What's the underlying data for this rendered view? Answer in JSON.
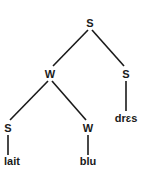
{
  "diagram": {
    "type": "metrical-tree",
    "nodes": {
      "root": {
        "label": "S",
        "x": 90,
        "y": 27
      },
      "w1": {
        "label": "W",
        "x": 50,
        "y": 78
      },
      "s2": {
        "label": "S",
        "x": 126,
        "y": 78
      },
      "s3": {
        "label": "S",
        "x": 8,
        "y": 132
      },
      "w2": {
        "label": "W",
        "x": 88,
        "y": 132
      }
    },
    "leaves": {
      "lait": {
        "label": "lait",
        "x": 12,
        "y": 165
      },
      "blu": {
        "label": "blu",
        "x": 88,
        "y": 165
      },
      "dres": {
        "label": "drɛs",
        "x": 126,
        "y": 122
      }
    },
    "colors": {
      "line": "#1a1a1a",
      "text": "#1a1a1a",
      "background": "#ffffff"
    }
  }
}
